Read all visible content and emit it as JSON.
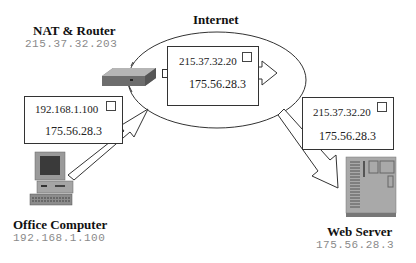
{
  "internet": {
    "label": "Internet"
  },
  "nodes": {
    "router": {
      "title": "NAT & Router",
      "ip": "215.37.32.203",
      "icon": "router-icon"
    },
    "office": {
      "title": "Office Computer",
      "ip": "192.168.1.100",
      "icon": "desktop-computer-icon"
    },
    "server": {
      "title": "Web Server",
      "ip": "175.56.28.3",
      "icon": "server-icon"
    }
  },
  "packets": {
    "outgoing": {
      "source": "192.168.1.100",
      "destination": "175.56.28.3"
    },
    "translated": {
      "source": "215.37.32.20",
      "destination": "175.56.28.3"
    },
    "delivered": {
      "source": "215.37.32.20",
      "destination": "175.56.28.3"
    }
  },
  "colors": {
    "stroke": "#333333",
    "ip_text": "#8a8a8a",
    "device_gray": "#9a9a9a"
  }
}
